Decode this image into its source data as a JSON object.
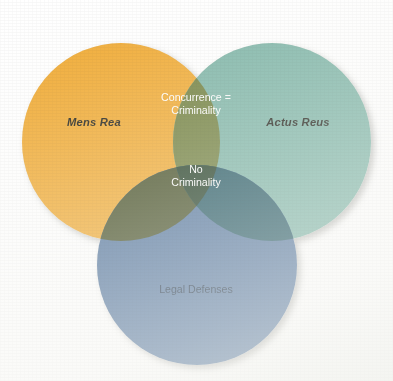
{
  "figure": {
    "kind": "venn-diagram-3-set",
    "background_color": "#FFFFFF"
  },
  "chart_data": {
    "type": "venn",
    "title": "",
    "subtitle": "",
    "xlabel": "",
    "ylabel": "",
    "grid": false,
    "legend_position": "none",
    "set_count": 3,
    "sets": [
      {
        "id": "mens_rea",
        "label": "Mens Rea",
        "color": "#F0A82E",
        "label_style": "bold-italic",
        "label_color": "#1B1B14",
        "cx": 121,
        "cy": 142,
        "r": 99
      },
      {
        "id": "actus_reus",
        "label": "Actus Reus",
        "color": "#7BB3A5",
        "label_style": "bold-italic",
        "label_color": "#1B1B14",
        "cx": 272,
        "cy": 142,
        "r": 99
      },
      {
        "id": "legal_defenses",
        "label": "Legal Defenses",
        "color": "#4E719B",
        "label_style": "regular",
        "label_color": "#12263C",
        "cx": 197,
        "cy": 265,
        "r": 100
      }
    ],
    "intersections": [
      {
        "id": "mens_rea__actus_reus",
        "sets": [
          "mens_rea",
          "actus_reus"
        ],
        "label_lines": [
          "Concurrence =",
          "Criminality"
        ],
        "color": "#6E7D3A",
        "label_color": "#FFFFFF"
      },
      {
        "id": "mens_rea__legal_defenses",
        "sets": [
          "mens_rea",
          "legal_defenses"
        ],
        "label_lines": [],
        "color": "#414B21",
        "label_color": "#FFFFFF"
      },
      {
        "id": "actus_reus__legal_defenses",
        "sets": [
          "actus_reus",
          "legal_defenses"
        ],
        "label_lines": [],
        "color": "#1F5460",
        "label_color": "#FFFFFF"
      },
      {
        "id": "all_three",
        "sets": [
          "mens_rea",
          "actus_reus",
          "legal_defenses"
        ],
        "label_lines": [
          "No",
          "Criminality"
        ],
        "color": "#1E3A21",
        "label_color": "#FFFFFF"
      }
    ],
    "annotations": [
      {
        "id": "label-mens-rea",
        "text": "Mens Rea",
        "x": 94,
        "y": 126
      },
      {
        "id": "label-actus-reus",
        "text": "Actus Reus",
        "x": 298,
        "y": 126
      },
      {
        "id": "label-concurrence-1",
        "text": "Concurrence =",
        "x": 196,
        "y": 101
      },
      {
        "id": "label-concurrence-2",
        "text": "Criminality",
        "x": 196,
        "y": 114
      },
      {
        "id": "label-no-crim-1",
        "text": "No",
        "x": 196,
        "y": 173
      },
      {
        "id": "label-no-crim-2",
        "text": "Criminality",
        "x": 196,
        "y": 186
      },
      {
        "id": "label-legal-defenses",
        "text": "Legal Defenses",
        "x": 196,
        "y": 293
      }
    ]
  },
  "labels": {
    "mens_rea": "Mens Rea",
    "actus_reus": "Actus Reus",
    "concurrence_line1": "Concurrence =",
    "concurrence_line2": "Criminality",
    "no_criminality_line1": "No",
    "no_criminality_line2": "Criminality",
    "legal_defenses": "Legal Defenses"
  },
  "colors": {
    "mens_rea": "#F0A82E",
    "actus_reus": "#7BB3A5",
    "legal_defenses": "#4E719B",
    "mens_actus_overlap": "#6E7D3A",
    "mens_defenses_overlap": "#414B21",
    "actus_defenses_overlap": "#1F5460",
    "triple_overlap": "#1E3A21",
    "text_dark": "#1B1B14",
    "text_navy": "#12263C",
    "text_light": "#FFFFFF",
    "background": "#FFFFFF"
  }
}
